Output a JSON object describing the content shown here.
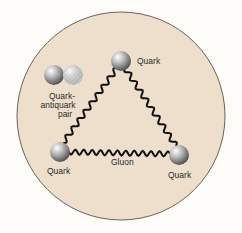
{
  "diagram": {
    "colors": {
      "background": "#fdfcf9",
      "disc": "#eedfcd",
      "disc_border": "#6b6258",
      "gluon": "#111111"
    },
    "labels": {
      "top_quark": "Quark",
      "left_quark": "Quark",
      "right_quark": "Quark",
      "gluon": "Gluon",
      "pair_line1": "Quark-",
      "pair_line2": "antiquark",
      "pair_line3": "pair"
    }
  }
}
